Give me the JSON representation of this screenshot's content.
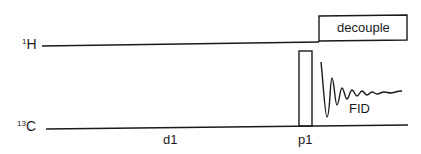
{
  "diagram": {
    "channels": [
      {
        "id": "1H",
        "mass": "1",
        "element": "H"
      },
      {
        "id": "13C",
        "mass": "13",
        "element": "C"
      }
    ],
    "labels": {
      "decouple": "decouple",
      "delay": "d1",
      "pulse": "p1",
      "fid": "FID"
    },
    "colors": {
      "line": "#1a1a1a",
      "background": "#ffffff"
    }
  }
}
